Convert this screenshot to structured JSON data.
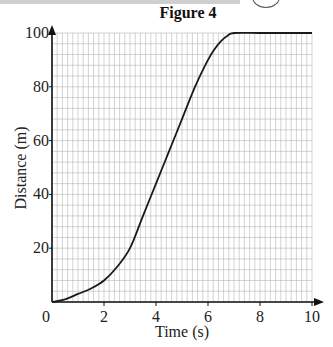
{
  "chart_data": {
    "type": "line",
    "title": "Figure 4",
    "xlabel": "Time (s)",
    "ylabel": "Distance (m)",
    "xlim": [
      0,
      10
    ],
    "ylim": [
      0,
      100
    ],
    "xticks": [
      0,
      2,
      4,
      6,
      8,
      10
    ],
    "yticks": [
      20,
      40,
      60,
      80,
      100
    ],
    "grid": true,
    "grid_minor_x_step": 0.2,
    "grid_minor_y_step": 4,
    "series": [
      {
        "name": "distance",
        "x": [
          0,
          0.5,
          1,
          1.5,
          2,
          2.5,
          3,
          3.5,
          4,
          4.5,
          5,
          5.5,
          6,
          6.25,
          6.5,
          6.75,
          7,
          8,
          9,
          10
        ],
        "y": [
          0,
          1,
          3,
          5,
          8,
          13,
          20,
          32,
          44,
          56,
          68,
          80,
          90,
          94,
          97,
          99,
          100,
          100,
          100,
          100
        ]
      }
    ]
  },
  "colors": {
    "grid": "#b5b5b5",
    "axis": "#111111",
    "line": "#1a1a1a"
  }
}
